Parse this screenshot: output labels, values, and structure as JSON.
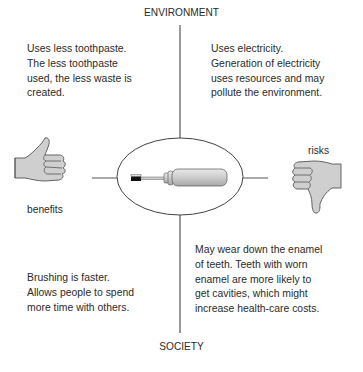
{
  "diagram": {
    "axes": {
      "top": "ENVIRONMENT",
      "bottom": "SOCIETY"
    },
    "quadrants": {
      "environment_benefits": "Uses less toothpaste.\nThe less toothpaste\nused, the less waste is\ncreated.",
      "environment_risks": "Uses electricity.\nGeneration of electricity\nuses resources and may\npollute the environment.",
      "society_benefits": "Brushing is faster.\nAllows people to spend\nmore time with others.",
      "society_risks": "May wear down the enamel\nof teeth. Teeth with worn\nenamel are more likely to\nget cavities, which might\nincrease health-care costs."
    },
    "side_labels": {
      "left": "benefits",
      "right": "risks"
    },
    "icons": {
      "left": "thumbs-up-icon",
      "right": "thumbs-down-icon",
      "center": "electric-toothbrush-icon"
    }
  }
}
